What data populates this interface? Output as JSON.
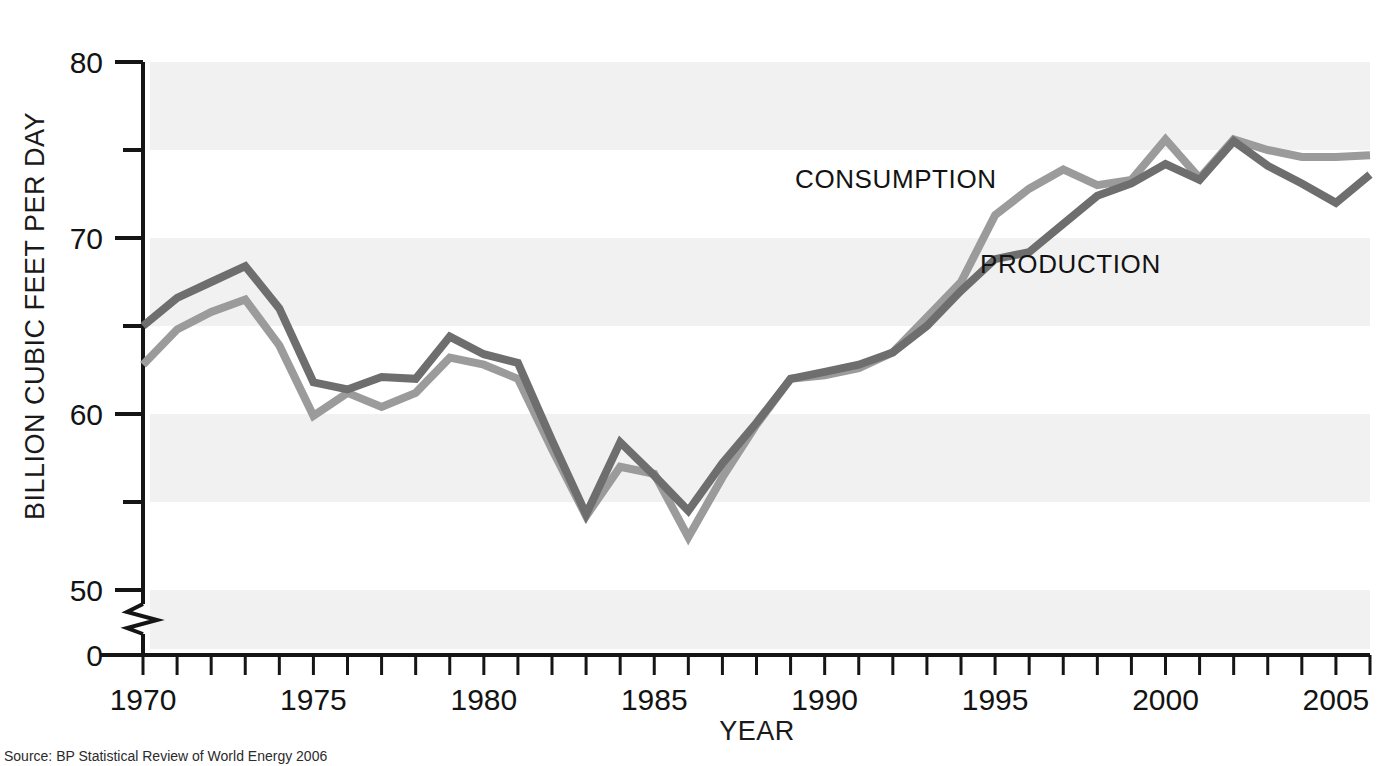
{
  "chart_data": {
    "type": "line",
    "title": "",
    "xlabel": "YEAR",
    "ylabel": "BILLION CUBIC FEET PER DAY",
    "xlim": [
      1970,
      2006
    ],
    "ylim": [
      50,
      80
    ],
    "y_axis_break": true,
    "y_baseline_label": "0",
    "grid": "alternating horizontal bands every 5 units",
    "legend_position": "inline annotations on plot",
    "x_ticks_major": [
      "1970",
      "1975",
      "1980",
      "1985",
      "1990",
      "1995",
      "2000",
      "2005"
    ],
    "x_ticks_major_values": [
      1970,
      1975,
      1980,
      1985,
      1990,
      1995,
      2000,
      2005
    ],
    "x_tick_interval_minor": 1,
    "y_ticks_major": [
      "80",
      "70",
      "60",
      "50",
      "0"
    ],
    "y_ticks_major_values": [
      80,
      70,
      60,
      50,
      0
    ],
    "y_ticks_minor_values": [
      75,
      65,
      55
    ],
    "x": [
      1970,
      1971,
      1972,
      1973,
      1974,
      1975,
      1976,
      1977,
      1978,
      1979,
      1980,
      1981,
      1982,
      1983,
      1984,
      1985,
      1986,
      1987,
      1988,
      1989,
      1990,
      1991,
      1992,
      1993,
      1994,
      1995,
      1996,
      1997,
      1998,
      1999,
      2000,
      2001,
      2002,
      2003,
      2004,
      2005,
      2006
    ],
    "series": [
      {
        "name": "PRODUCTION",
        "color": "#6e6e6e",
        "values": [
          65.0,
          66.6,
          67.5,
          68.4,
          66.0,
          61.8,
          61.4,
          62.1,
          62.0,
          64.4,
          63.4,
          62.9,
          58.5,
          54.3,
          58.4,
          56.5,
          54.5,
          57.2,
          59.5,
          62.0,
          62.4,
          62.8,
          63.5,
          65.0,
          67.0,
          68.8,
          69.2,
          70.8,
          72.4,
          73.1,
          74.2,
          73.3,
          75.5,
          74.1,
          73.1,
          72.0,
          73.6
        ]
      },
      {
        "name": "CONSUMPTION",
        "color": "#9b9b9b",
        "values": [
          62.8,
          64.8,
          65.8,
          66.5,
          63.9,
          59.9,
          61.2,
          60.4,
          61.2,
          63.2,
          62.8,
          62.0,
          58.0,
          54.2,
          57.0,
          56.6,
          53.0,
          56.4,
          59.4,
          62.0,
          62.2,
          62.6,
          63.5,
          65.5,
          67.5,
          71.3,
          72.8,
          73.9,
          73.0,
          73.3,
          75.6,
          73.4,
          75.6,
          75.0,
          74.6,
          74.6,
          74.7
        ]
      }
    ],
    "annotations": [
      {
        "label": "CONSUMPTION",
        "x_px": 795,
        "y_px": 188
      },
      {
        "label": "PRODUCTION",
        "x_px": 980,
        "y_px": 273
      }
    ]
  },
  "source": {
    "prefix": "Source:",
    "text": "BP Statistical Review of World Energy 2006"
  },
  "colors": {
    "band": "#f1f1f1",
    "axis": "#151515",
    "production": "#6e6e6e",
    "consumption": "#9b9b9b",
    "text": "#131313"
  }
}
